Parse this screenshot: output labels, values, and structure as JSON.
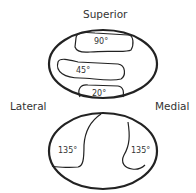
{
  "labels": {
    "superior": "Superior",
    "lateral": "Lateral",
    "medial": "Medial"
  },
  "top_oval": {
    "regions": [
      {
        "label": "90°"
      },
      {
        "label": "45°"
      },
      {
        "label": "20°"
      }
    ]
  },
  "bottom_oval": {
    "regions": [
      {
        "label": "135°"
      },
      {
        "label": "135°"
      }
    ]
  }
}
